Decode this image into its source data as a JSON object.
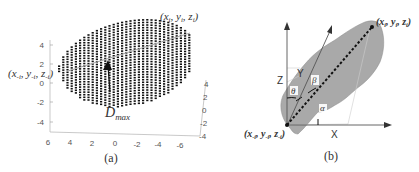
{
  "panel_a": {
    "caption": "(a)",
    "label_max": "(x",
    "label_max_sub": "i",
    "label_max_text": "(xi, yi, zi)",
    "label_min_text": "(x-i, y-i, z-i)",
    "dmax": "D",
    "dmax_sub": "max",
    "z_ticks": [
      "4",
      "2",
      "0",
      "-2",
      "-4"
    ],
    "x_ticks": [
      "6",
      "4",
      "2",
      "0",
      "-2",
      "-4",
      "-6"
    ],
    "y_ticks": [
      "4",
      "2",
      "0",
      "-2",
      "-4"
    ],
    "point_color": "#111111"
  },
  "panel_b": {
    "caption": "(b)",
    "label_max_text": "(xi, yi, zi)",
    "label_min_text": "(x-i, y-i, z-i)",
    "axis_z": "Z",
    "axis_y": "Y",
    "axis_x": "X",
    "angle_alpha": "α",
    "angle_beta": "β",
    "angle_theta": "θ",
    "blob_color": "#9a9a9a"
  }
}
